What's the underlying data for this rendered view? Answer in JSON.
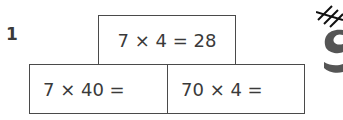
{
  "question": {
    "number": "1"
  },
  "pyramid": {
    "top": "7 × 4 = 28",
    "bottom_left": "7 × 40 =",
    "bottom_right": "70 × 4 ="
  },
  "decoration": {
    "icon": "hash-doodle-icon"
  }
}
